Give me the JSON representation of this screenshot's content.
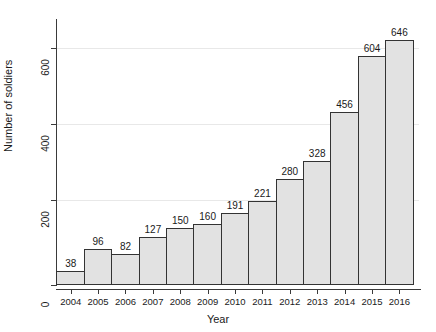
{
  "chart_data": {
    "type": "bar",
    "title": "",
    "xlabel": "Year",
    "ylabel": "Number of soldiers",
    "categories": [
      "2004",
      "2005",
      "2006",
      "2007",
      "2008",
      "2009",
      "2010",
      "2011",
      "2012",
      "2013",
      "2014",
      "2015",
      "2016"
    ],
    "values": [
      38,
      96,
      82,
      127,
      150,
      160,
      191,
      221,
      280,
      328,
      456,
      604,
      646
    ],
    "ylim": [
      0,
      700
    ],
    "yticks": [
      0,
      200,
      400,
      600
    ],
    "ytick_labels": [
      "0",
      "200",
      "400",
      "600"
    ],
    "grid": "horizontal",
    "legend": "none",
    "bar_fill": "#e2e2e2",
    "bar_border": "#333333",
    "gridline_color": "#e8e8e8",
    "axis_color": "#3a3a3a",
    "bars_contiguous": true,
    "value_labels_shown": true
  }
}
